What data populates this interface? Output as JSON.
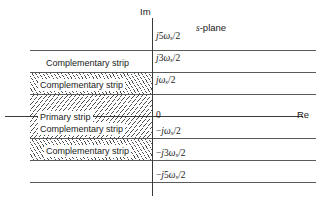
{
  "figure": {
    "plane_label": "s-plane",
    "plane_label_italic": "s",
    "plane_label_rest": "-plane",
    "axes": {
      "imaginary_label": "Im",
      "real_label": "Re"
    },
    "tick_labels": [
      {
        "id": "j5ws-2",
        "text": "j5ωs/2",
        "y": 33
      },
      {
        "id": "j3ws-2",
        "text": "j3ωs/2",
        "y": 55
      },
      {
        "id": "jws-2",
        "text": "jωs/2",
        "y": 77
      },
      {
        "id": "zero",
        "text": "0",
        "y": 113
      },
      {
        "id": "neg-jws-2",
        "text": "−jωs/2",
        "y": 128
      },
      {
        "id": "neg-j3ws-2",
        "text": "−3jωs/2",
        "y": 150
      },
      {
        "id": "neg-j5ws-2",
        "text": "−j5ωs/2",
        "y": 172
      }
    ],
    "strips": [
      {
        "id": "complementary-upper-2",
        "label": "Complementary strip",
        "hatched": false,
        "y": 57,
        "x": 44
      },
      {
        "id": "complementary-upper-1",
        "label": "Complementary strip",
        "hatched": true,
        "y": 79,
        "x": 38
      },
      {
        "id": "primary",
        "label": "Primary strip",
        "hatched": true,
        "y": 111,
        "x": 38
      },
      {
        "id": "complementary-lower-1",
        "label": "Complementary strip",
        "hatched": true,
        "y": 123,
        "x": 38
      },
      {
        "id": "complementary-lower-2",
        "label": "Complementary strip",
        "hatched": false,
        "y": 145,
        "x": 44
      }
    ]
  }
}
